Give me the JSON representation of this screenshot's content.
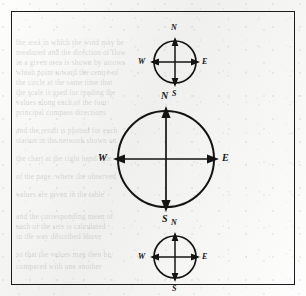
{
  "figure": {
    "kind": "compass-rose-diagram",
    "border_color": "#1b1b1b",
    "ink_color": "#141414",
    "paper_color": "#f3f3f1",
    "compasses": [
      {
        "id": "top",
        "size": "small",
        "center_x": 152,
        "center_y": 50,
        "radius": 22,
        "label_font_size": 8,
        "labels": {
          "north": "N",
          "east": "E",
          "south": "S",
          "west": "W"
        }
      },
      {
        "id": "middle",
        "size": "large",
        "center_x": 155,
        "center_y": 147,
        "radius": 50,
        "label_font_size": 10,
        "labels": {
          "north": "N",
          "east": "E",
          "south": "S",
          "west": "W"
        }
      },
      {
        "id": "bottom",
        "size": "small",
        "center_x": 152,
        "center_y": 245,
        "radius": 22,
        "label_font_size": 8,
        "labels": {
          "north": "N",
          "east": "E",
          "south": "S",
          "west": "W"
        }
      }
    ]
  },
  "ghost_lines": [
    {
      "x": 16,
      "y": 38,
      "text": "the area in which the wind may be"
    },
    {
      "x": 16,
      "y": 48,
      "text": "measured and the direction of flow"
    },
    {
      "x": 16,
      "y": 58,
      "text": "in a given area is shown by arrows"
    },
    {
      "x": 16,
      "y": 68,
      "text": "which point toward the centre of"
    },
    {
      "x": 16,
      "y": 78,
      "text": "the circle at the same time that"
    },
    {
      "x": 16,
      "y": 88,
      "text": "the scale is used for reading the"
    },
    {
      "x": 16,
      "y": 98,
      "text": "values along each of the four"
    },
    {
      "x": 16,
      "y": 108,
      "text": "principal compass directions"
    },
    {
      "x": 16,
      "y": 126,
      "text": "and the result is plotted for each"
    },
    {
      "x": 16,
      "y": 136,
      "text": "station in the network shown on"
    },
    {
      "x": 16,
      "y": 154,
      "text": "the chart at the right hand side"
    },
    {
      "x": 16,
      "y": 172,
      "text": "of the page, where the observed"
    },
    {
      "x": 16,
      "y": 190,
      "text": "values are given in the table"
    },
    {
      "x": 16,
      "y": 212,
      "text": "and the corresponding mean of"
    },
    {
      "x": 16,
      "y": 222,
      "text": "each of the sets is calculated"
    },
    {
      "x": 16,
      "y": 232,
      "text": "in the way described above"
    },
    {
      "x": 16,
      "y": 250,
      "text": "so that the values may then be"
    },
    {
      "x": 16,
      "y": 262,
      "text": "compared with one another"
    }
  ]
}
